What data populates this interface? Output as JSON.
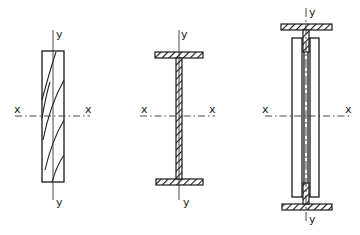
{
  "figures": [
    {
      "id": "solid-rectangular-section",
      "description": "Solid timber rectangular section with grain lines",
      "labels": {
        "x_left": "x",
        "x_right": "x",
        "y_top": "y",
        "y_bottom": "y"
      }
    },
    {
      "id": "i-beam-section",
      "description": "I-section with hatched flanges and web",
      "labels": {
        "x_left": "x",
        "x_right": "x",
        "y_top": "y",
        "y_bottom": "y"
      }
    },
    {
      "id": "built-up-section",
      "description": "Built-up section with hatched flanges, side boards and central web",
      "labels": {
        "x_left": "x",
        "x_right": "x",
        "y_top": "y",
        "y_bottom": "y"
      }
    }
  ],
  "colors": {
    "line": "#1a1a1a",
    "background": "#ffffff"
  }
}
